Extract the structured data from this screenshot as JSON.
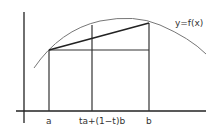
{
  "diagram": {
    "curve_label": "y=f(x)",
    "x_labels": {
      "a": "a",
      "mid": "ta+(1−t)b",
      "b": "b"
    },
    "colors": {
      "axis": "#222222",
      "curve": "#777777",
      "lines": "#333333"
    }
  }
}
